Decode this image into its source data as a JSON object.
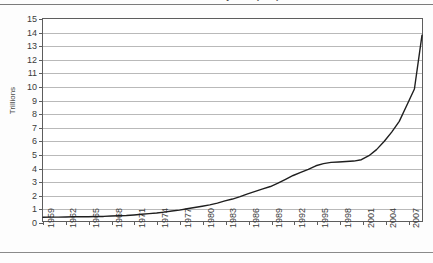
{
  "chart_data": {
    "type": "line",
    "title": "Total US Monetary Debt (US$)",
    "xlabel": "",
    "ylabel": "Trillions",
    "ylim": [
      0,
      15
    ],
    "xlim": [
      1959,
      2009
    ],
    "ytick_labels": [
      "15",
      "14",
      "13",
      "12",
      "11",
      "10",
      "9",
      "8",
      "7",
      "6",
      "5",
      "4",
      "3",
      "2",
      "1",
      "0"
    ],
    "ytick_values": [
      15,
      14,
      13,
      12,
      11,
      10,
      9,
      8,
      7,
      6,
      5,
      4,
      3,
      2,
      1,
      0
    ],
    "xtick_labels": [
      "1959",
      "1962",
      "1965",
      "1968",
      "1971",
      "1974",
      "1977",
      "1980",
      "1983",
      "1986",
      "1989",
      "1992",
      "1995",
      "1998",
      "2001",
      "2004",
      "2007"
    ],
    "xtick_values": [
      1959,
      1962,
      1965,
      1968,
      1971,
      1974,
      1977,
      1980,
      1983,
      1986,
      1989,
      1992,
      1995,
      1998,
      2001,
      2004,
      2007
    ],
    "grid": true,
    "legend": false,
    "line_color": "#1f1f1f",
    "grid_color": "#b9b9b9",
    "axis_color": "#5d5d5d",
    "series": [
      {
        "name": "Total debt",
        "x": [
          1959,
          1960,
          1961,
          1962,
          1963,
          1964,
          1965,
          1966,
          1967,
          1968,
          1969,
          1970,
          1971,
          1972,
          1973,
          1974,
          1975,
          1976,
          1977,
          1978,
          1979,
          1980,
          1981,
          1982,
          1983,
          1984,
          1985,
          1986,
          1987,
          1988,
          1989,
          1990,
          1991,
          1992,
          1993,
          1994,
          1995,
          1996,
          1997,
          1998,
          1999,
          2000,
          2001,
          2002,
          2003,
          2004,
          2005,
          2006,
          2007,
          2008,
          2009
        ],
        "values": [
          0.28,
          0.29,
          0.29,
          0.3,
          0.31,
          0.31,
          0.32,
          0.33,
          0.34,
          0.37,
          0.39,
          0.41,
          0.45,
          0.5,
          0.55,
          0.59,
          0.66,
          0.74,
          0.81,
          0.91,
          1.0,
          1.1,
          1.2,
          1.33,
          1.49,
          1.63,
          1.81,
          2.02,
          2.2,
          2.38,
          2.56,
          2.81,
          3.1,
          3.38,
          3.61,
          3.84,
          4.1,
          4.26,
          4.35,
          4.38,
          4.42,
          4.45,
          4.55,
          4.85,
          5.3,
          5.9,
          6.6,
          7.4,
          8.6,
          9.8,
          13.8
        ]
      }
    ],
    "annotations": [
      {
        "label": "plateau",
        "x_range": [
          1995,
          1999
        ],
        "y": 4.4
      },
      {
        "label": "2008 dip",
        "x": 2008,
        "y": 9.8
      }
    ]
  },
  "axes": {
    "y_title": "Trillions"
  }
}
